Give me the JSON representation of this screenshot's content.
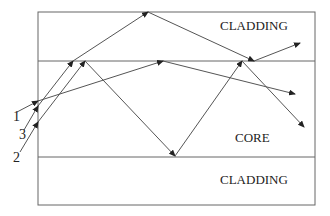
{
  "diagram": {
    "type": "optical-fiber-ray-propagation",
    "regions": {
      "top_cladding": "CLADDING",
      "core": "CORE",
      "bottom_cladding": "CLADDING"
    },
    "ray_labels": [
      "1",
      "3",
      "2"
    ],
    "colors": {
      "line": "#555555",
      "text": "#222222",
      "background": "#ffffff"
    }
  }
}
